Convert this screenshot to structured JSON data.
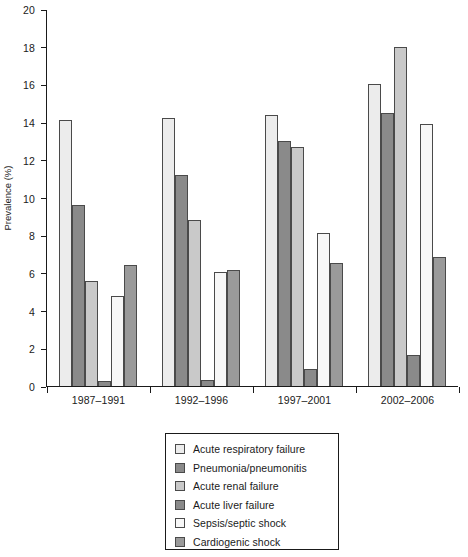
{
  "chart_data": {
    "type": "bar",
    "title": "",
    "subtitle": "",
    "xlabel": "",
    "ylabel": "Prevalence (%)",
    "ylim": [
      0,
      20
    ],
    "ytick_step": 2,
    "yticks": [
      20,
      18,
      16,
      14,
      12,
      10,
      8,
      6,
      4,
      2,
      0
    ],
    "grid": false,
    "legend_position": "below-plot",
    "categories": [
      "1987–1991",
      "1992–1996",
      "1997–2001",
      "2002–2006"
    ],
    "series": [
      {
        "name": "Acute respiratory failure",
        "color": "#ececec",
        "values": [
          14.1,
          14.2,
          14.4,
          16.0
        ]
      },
      {
        "name": "Pneumonia/pneumonitis",
        "color": "#8a8a8a",
        "values": [
          9.6,
          11.2,
          13.0,
          14.5
        ]
      },
      {
        "name": "Acute renal failure",
        "color": "#c9c9c9",
        "values": [
          5.55,
          8.8,
          12.7,
          18.0
        ]
      },
      {
        "name": "Acute liver failure",
        "color": "#8a8a8a",
        "values": [
          0.25,
          0.3,
          0.9,
          1.65
        ]
      },
      {
        "name": "Sepsis/septic shock",
        "color": "#f7f7f7",
        "values": [
          4.8,
          6.05,
          8.1,
          13.9
        ]
      },
      {
        "name": "Cardiogenic shock",
        "color": "#9a9a9a",
        "values": [
          6.4,
          6.15,
          6.55,
          6.85
        ]
      }
    ]
  },
  "legend": {
    "items": [
      {
        "label": "Acute respiratory failure",
        "color": "#ececec"
      },
      {
        "label": "Pneumonia/pneumonitis",
        "color": "#8a8a8a"
      },
      {
        "label": "Acute renal failure",
        "color": "#c9c9c9"
      },
      {
        "label": "Acute liver failure",
        "color": "#8a8a8a"
      },
      {
        "label": "Sepsis/septic shock",
        "color": "#f7f7f7"
      },
      {
        "label": "Cardiogenic shock",
        "color": "#9a9a9a"
      }
    ]
  }
}
